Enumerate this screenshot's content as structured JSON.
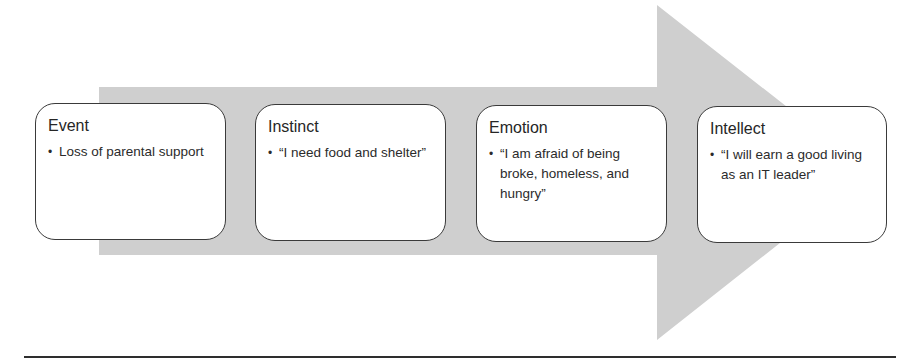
{
  "diagram": {
    "type": "process-arrow",
    "arrow_color": "#cfcfcf",
    "box_border_color": "#3a3a3a",
    "steps": [
      {
        "title": "Event",
        "bullets": [
          "Loss of parental support"
        ]
      },
      {
        "title": "Instinct",
        "bullets": [
          "“I need food and shelter”"
        ]
      },
      {
        "title": "Emotion",
        "bullets": [
          "“I am afraid of being broke, homeless, and hungry”"
        ]
      },
      {
        "title": "Intellect",
        "bullets": [
          "“I will earn a good living as an IT leader”"
        ]
      }
    ],
    "bullet_glyph": "•"
  }
}
